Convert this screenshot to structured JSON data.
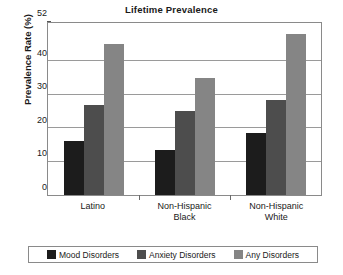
{
  "chart_data": {
    "type": "bar",
    "title": "Lifetime Prevalence",
    "xlabel": "",
    "ylabel": "Prevalence Rate (%)",
    "categories": [
      "Latino",
      "Non-Hispanic Black",
      "Non-Hispanic White"
    ],
    "category_lines": [
      [
        "Latino"
      ],
      [
        "Non-Hispanic",
        "Black"
      ],
      [
        "Non-Hispanic",
        "White"
      ]
    ],
    "series": [
      {
        "name": "Mood Disorders",
        "color": "#1c1c1c",
        "values": [
          16.0,
          13.5,
          18.5
        ]
      },
      {
        "name": "Anxiety Disorders",
        "color": "#4d4d4d",
        "values": [
          27.0,
          25.0,
          28.5
        ]
      },
      {
        "name": "Any Disorders",
        "color": "#858585",
        "values": [
          45.0,
          35.0,
          48.0
        ]
      }
    ],
    "ylim": [
      0,
      52
    ],
    "yticks": [
      0,
      10,
      20,
      30,
      40,
      52
    ],
    "ytick_labels": [
      "0",
      "10",
      "20",
      "30",
      "40",
      "52"
    ],
    "grid": true,
    "legend_position": "bottom",
    "axis_color": "#8a8a8a",
    "grid_color": "#9a9a9a",
    "background": "#ffffff"
  }
}
